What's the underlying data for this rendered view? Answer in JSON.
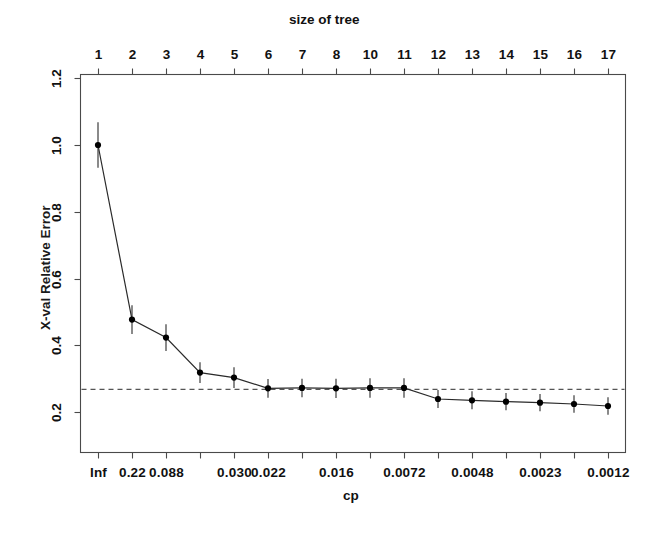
{
  "figure": {
    "top_axis_title": "size of tree",
    "bottom_axis_title": "cp",
    "y_axis_title": "X-val Relative Error"
  },
  "chart_data": {
    "type": "line",
    "title": "",
    "subtitle": "",
    "xlabel": "cp",
    "ylabel": "X-val Relative Error",
    "top_xlabel": "size of tree",
    "grid": false,
    "legend": "none",
    "ylim": [
      0.12,
      1.25
    ],
    "y_ticks": [
      0.2,
      0.4,
      0.6,
      0.8,
      1.0,
      1.2
    ],
    "y_tick_labels": [
      "0.2",
      "0.4",
      "0.6",
      "0.8",
      "1.0",
      "1.2"
    ],
    "x_index": [
      1,
      2,
      3,
      4,
      5,
      6,
      7,
      8,
      9,
      10,
      11,
      12,
      13,
      14,
      15,
      16
    ],
    "top_tick_labels": [
      "1",
      "2",
      "3",
      "4",
      "5",
      "6",
      "7",
      "8",
      "10",
      "11",
      "12",
      "13",
      "14",
      "15",
      "16",
      "17"
    ],
    "bottom_tick_labels": [
      "Inf",
      "0.22",
      "0.088",
      "",
      "0.030",
      "0.022",
      "",
      "0.016",
      "",
      "0.0072",
      "",
      "0.0048",
      "",
      "0.0023",
      "",
      "0.0012"
    ],
    "series": [
      {
        "name": "xerror",
        "values": [
          1.0,
          0.477,
          0.423,
          0.318,
          0.303,
          0.271,
          0.272,
          0.271,
          0.272,
          0.272,
          0.239,
          0.235,
          0.231,
          0.228,
          0.224,
          0.218
        ],
        "errors": [
          0.068,
          0.043,
          0.04,
          0.031,
          0.031,
          0.028,
          0.028,
          0.029,
          0.029,
          0.029,
          0.027,
          0.027,
          0.026,
          0.026,
          0.026,
          0.026
        ],
        "marker": "filled-circle",
        "color": "#000000"
      }
    ],
    "reference_line": {
      "name": "1-SE threshold",
      "y": 0.268,
      "style": "dashed",
      "color": "#555555"
    }
  }
}
